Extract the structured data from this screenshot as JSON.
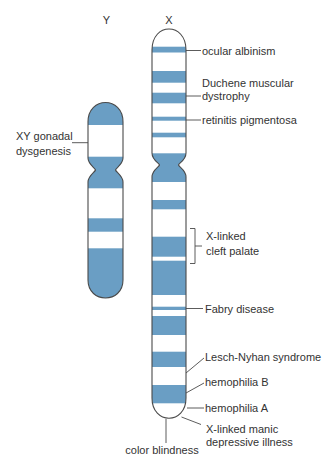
{
  "figure": {
    "colors": {
      "band": "#6a9ec4",
      "outline": "#4a4a4a",
      "text": "#333333",
      "background": "#ffffff"
    },
    "chromosomes": [
      {
        "id": "Y",
        "label": "Y",
        "bands": [
          [
            98,
            125
          ],
          [
            156.7,
            188.3
          ],
          [
            218.3,
            231.7
          ],
          [
            248.3,
            302
          ]
        ]
      },
      {
        "id": "X",
        "label": "X",
        "bands": [
          [
            46.7,
            52.5
          ],
          [
            71,
            82.7
          ],
          [
            92.7,
            103.3
          ],
          [
            116.7,
            120.7
          ],
          [
            132.7,
            137.3
          ],
          [
            153.3,
            182
          ],
          [
            200,
            209.3
          ],
          [
            236.7,
            256.7
          ],
          [
            260.7,
            295
          ],
          [
            306.7,
            310
          ],
          [
            316,
            335
          ],
          [
            351.7,
            367
          ],
          [
            385,
            403.3
          ]
        ]
      }
    ],
    "y_labels": {
      "xy_gonadal_dysgenesis": {
        "line1": "XY gonadal",
        "line2": "dysgenesis"
      }
    },
    "x_labels": {
      "ocular_albinism": "ocular albinism",
      "duchene_muscular_dystrophy": {
        "line1": "Duchene muscular",
        "line2": "dystrophy"
      },
      "retinitis_pigmentosa": "retinitis pigmentosa",
      "x_linked_cleft_palate": {
        "line1": "X-linked",
        "line2": "cleft palate"
      },
      "fabry_disease": "Fabry disease",
      "lesch_nyhan_syndrome": "Lesch-Nyhan syndrome",
      "hemophilia_b": "hemophilia B",
      "hemophilia_a": "hemophilia A",
      "x_linked_manic_depressive_illness": {
        "line1": "X-linked manic",
        "line2": "depressive illness"
      },
      "color_blindness": "color blindness"
    }
  }
}
